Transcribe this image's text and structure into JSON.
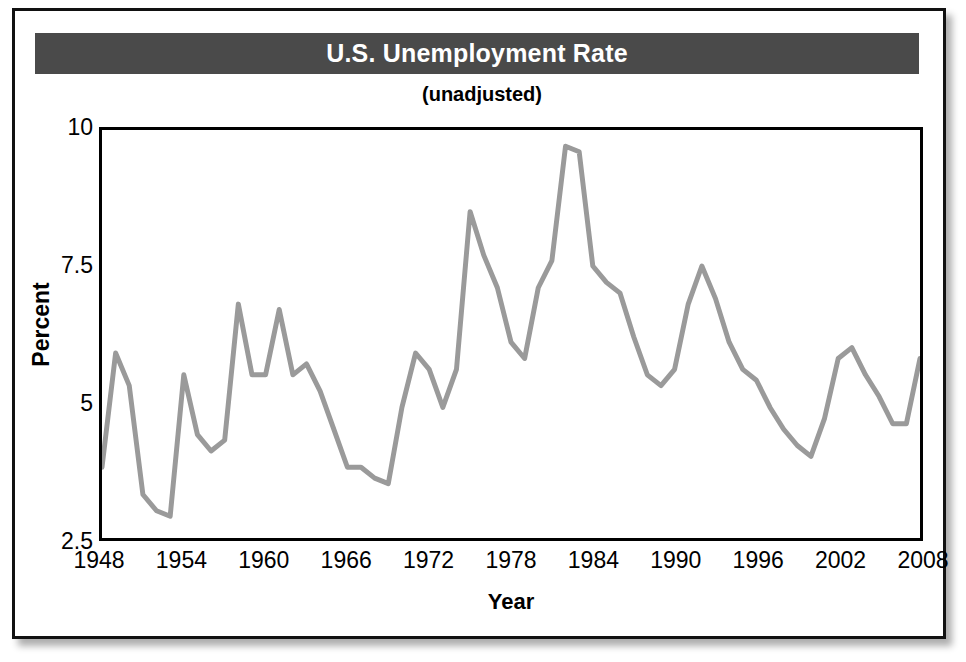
{
  "figure": {
    "title": "U.S. Unemployment Rate",
    "subtitle": "(unadjusted)",
    "title_banner_color": "#4a4a4a",
    "title_text_color": "#ffffff",
    "frame_color": "#111111",
    "background_color": "#ffffff"
  },
  "chart_data": {
    "type": "line",
    "title": "U.S. Unemployment Rate",
    "subtitle": "(unadjusted)",
    "xlabel": "Year",
    "ylabel": "Percent",
    "series_color": "#9a9a9a",
    "grid": false,
    "legend": false,
    "xlim": [
      1948,
      2008
    ],
    "ylim": [
      2.5,
      10
    ],
    "xticks": [
      1948,
      1954,
      1960,
      1966,
      1972,
      1978,
      1984,
      1990,
      1996,
      2002,
      2008
    ],
    "xtick_labels": [
      "1948",
      "1954",
      "1960",
      "1966",
      "1972",
      "1978",
      "1984",
      "1990",
      "1996",
      "2002",
      "2008"
    ],
    "yticks": [
      2.5,
      5,
      7.5,
      10
    ],
    "ytick_labels": [
      "2.5",
      "5",
      "7.5",
      "10"
    ],
    "x": [
      1948,
      1949,
      1950,
      1951,
      1952,
      1953,
      1954,
      1955,
      1956,
      1957,
      1958,
      1959,
      1960,
      1961,
      1962,
      1963,
      1964,
      1965,
      1966,
      1967,
      1968,
      1969,
      1970,
      1971,
      1972,
      1973,
      1974,
      1975,
      1976,
      1977,
      1978,
      1979,
      1980,
      1981,
      1982,
      1983,
      1984,
      1985,
      1986,
      1987,
      1988,
      1989,
      1990,
      1991,
      1992,
      1993,
      1994,
      1995,
      1996,
      1997,
      1998,
      1999,
      2000,
      2001,
      2002,
      2003,
      2004,
      2005,
      2006,
      2007,
      2008
    ],
    "values": [
      3.8,
      5.9,
      5.3,
      3.3,
      3.0,
      2.9,
      5.5,
      4.4,
      4.1,
      4.3,
      6.8,
      5.5,
      5.5,
      6.7,
      5.5,
      5.7,
      5.2,
      4.5,
      3.8,
      3.8,
      3.6,
      3.5,
      4.9,
      5.9,
      5.6,
      4.9,
      5.6,
      8.5,
      7.7,
      7.1,
      6.1,
      5.8,
      7.1,
      7.6,
      9.7,
      9.6,
      7.5,
      7.2,
      7.0,
      6.2,
      5.5,
      5.3,
      5.6,
      6.8,
      7.5,
      6.9,
      6.1,
      5.6,
      5.4,
      4.9,
      4.5,
      4.2,
      4.0,
      4.7,
      5.8,
      6.0,
      5.5,
      5.1,
      4.6,
      4.6,
      5.8
    ]
  }
}
